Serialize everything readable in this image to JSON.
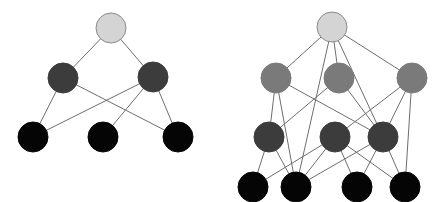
{
  "colors": {
    "background": "#ffffff",
    "edge": "#6e6e6e",
    "node_border": "#8a8a8a",
    "root": "#d4d4d4",
    "light_gray": "#7a7a7a",
    "dark_gray": "#3c3c3c",
    "black": "#050505"
  },
  "graphs": [
    {
      "name": "left-graph",
      "nodes": [
        {
          "id": "a",
          "x": 111,
          "y": 28,
          "r": 15,
          "fill": "root"
        },
        {
          "id": "b",
          "x": 63,
          "y": 78,
          "r": 15,
          "fill": "dark_gray"
        },
        {
          "id": "c",
          "x": 153,
          "y": 77,
          "r": 15,
          "fill": "dark_gray"
        },
        {
          "id": "d",
          "x": 33,
          "y": 137,
          "r": 15,
          "fill": "black"
        },
        {
          "id": "e",
          "x": 103,
          "y": 137,
          "r": 15,
          "fill": "black"
        },
        {
          "id": "f",
          "x": 178,
          "y": 137,
          "r": 15,
          "fill": "black"
        }
      ],
      "edges": [
        [
          "a",
          "b"
        ],
        [
          "a",
          "c"
        ],
        [
          "b",
          "d"
        ],
        [
          "b",
          "f"
        ],
        [
          "c",
          "d"
        ],
        [
          "c",
          "e"
        ],
        [
          "c",
          "f"
        ]
      ]
    },
    {
      "name": "right-graph",
      "nodes": [
        {
          "id": "r",
          "x": 332,
          "y": 27,
          "r": 15,
          "fill": "root"
        },
        {
          "id": "m1",
          "x": 276,
          "y": 78,
          "r": 15,
          "fill": "light_gray"
        },
        {
          "id": "m2",
          "x": 339,
          "y": 78,
          "r": 15,
          "fill": "light_gray"
        },
        {
          "id": "m3",
          "x": 412,
          "y": 78,
          "r": 15,
          "fill": "light_gray"
        },
        {
          "id": "n1",
          "x": 269,
          "y": 137,
          "r": 15,
          "fill": "dark_gray"
        },
        {
          "id": "n2",
          "x": 335,
          "y": 137,
          "r": 15,
          "fill": "dark_gray"
        },
        {
          "id": "n3",
          "x": 383,
          "y": 137,
          "r": 15,
          "fill": "dark_gray"
        },
        {
          "id": "k1",
          "x": 253,
          "y": 187,
          "r": 15,
          "fill": "black"
        },
        {
          "id": "k2",
          "x": 296,
          "y": 187,
          "r": 15,
          "fill": "black"
        },
        {
          "id": "k3",
          "x": 357,
          "y": 187,
          "r": 15,
          "fill": "black"
        },
        {
          "id": "k4",
          "x": 405,
          "y": 187,
          "r": 15,
          "fill": "black"
        }
      ],
      "edges": [
        [
          "r",
          "m1"
        ],
        [
          "r",
          "m2"
        ],
        [
          "r",
          "m3"
        ],
        [
          "r",
          "k2"
        ],
        [
          "r",
          "n3"
        ],
        [
          "m1",
          "n1"
        ],
        [
          "m1",
          "k2"
        ],
        [
          "m1",
          "n3"
        ],
        [
          "m2",
          "n1"
        ],
        [
          "m2",
          "n3"
        ],
        [
          "m3",
          "n2"
        ],
        [
          "m3",
          "n3"
        ],
        [
          "m3",
          "k4"
        ],
        [
          "n1",
          "k1"
        ],
        [
          "n1",
          "k2"
        ],
        [
          "n2",
          "k1"
        ],
        [
          "n2",
          "k2"
        ],
        [
          "n2",
          "k3"
        ],
        [
          "n2",
          "k4"
        ],
        [
          "n3",
          "k2"
        ],
        [
          "n3",
          "k3"
        ],
        [
          "n3",
          "k4"
        ]
      ]
    }
  ]
}
